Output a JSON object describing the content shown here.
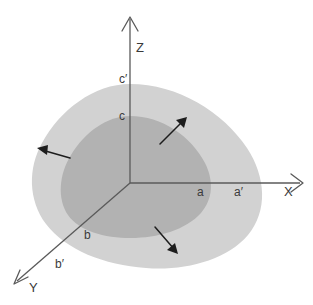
{
  "figure": {
    "title": "",
    "background_color": "#ffffff",
    "width": 313,
    "height": 305
  },
  "colors": {
    "outer_region": "#d2d2d2",
    "inner_region": "#b2b2b2",
    "axis": "#5a5a5a",
    "arrow": "#1d1d1d",
    "label": "#3a3a3a"
  },
  "axes": [
    {
      "id": "x-axis",
      "label": "X",
      "direction": "right",
      "origin": [
        130,
        183
      ],
      "tip": [
        303,
        183
      ],
      "label_pos": [
        284,
        193
      ]
    },
    {
      "id": "y-axis",
      "label": "Y",
      "direction": "down-left",
      "origin": [
        130,
        183
      ],
      "tip": [
        13,
        284
      ],
      "label_pos": [
        29,
        288
      ]
    },
    {
      "id": "z-axis",
      "label": "Z",
      "direction": "up",
      "origin": [
        130,
        183
      ],
      "tip": [
        130,
        16
      ],
      "label_pos": [
        137,
        47
      ]
    }
  ],
  "point_labels": [
    {
      "id": "label-a",
      "text": "a",
      "axis": "x",
      "pos": [
        197,
        195
      ],
      "surface": "inner"
    },
    {
      "id": "label-a-prime",
      "text": "a′",
      "axis": "x",
      "pos": [
        235,
        195
      ],
      "surface": "outer"
    },
    {
      "id": "label-b",
      "text": "b",
      "axis": "y",
      "pos": [
        85,
        238
      ],
      "surface": "inner"
    },
    {
      "id": "label-b-prime",
      "text": "b′",
      "axis": "y",
      "pos": [
        56,
        267
      ],
      "surface": "outer"
    },
    {
      "id": "label-c",
      "text": "c",
      "axis": "z",
      "pos": [
        120,
        119
      ],
      "surface": "inner"
    },
    {
      "id": "label-c-prime",
      "text": "c′",
      "axis": "z",
      "pos": [
        120,
        82
      ],
      "surface": "outer"
    }
  ],
  "regions": [
    {
      "id": "outer-region",
      "name": "expanded-cell-surface",
      "fill": "#d2d2d2",
      "description": "outer rounded-triangular octant surface through a', b', c'"
    },
    {
      "id": "inner-region",
      "name": "original-cell-surface",
      "fill": "#b2b2b2",
      "description": "inner rounded-triangular octant surface through a, b, c"
    }
  ],
  "growth_arrows": [
    {
      "id": "arrow-upper-right",
      "direction": "up-right",
      "from": [
        160,
        144
      ],
      "to": [
        186,
        118
      ]
    },
    {
      "id": "arrow-left",
      "direction": "left",
      "from": [
        70,
        158
      ],
      "to": [
        38,
        149
      ]
    },
    {
      "id": "arrow-lower-right",
      "direction": "down-right",
      "from": [
        155,
        227
      ],
      "to": [
        177,
        253
      ]
    }
  ]
}
